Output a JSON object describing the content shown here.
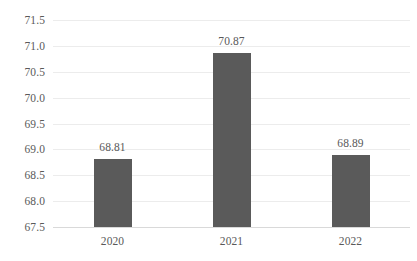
{
  "chart_data": {
    "type": "bar",
    "title": "",
    "subtitle": "",
    "xlabel": "",
    "ylabel": "",
    "categories": [
      "2020",
      "2021",
      "2022"
    ],
    "values": [
      68.81,
      70.87,
      68.89
    ],
    "data_labels": [
      "68.81",
      "70.87",
      "68.89"
    ],
    "ylim": [
      67.5,
      71.5
    ],
    "ytick_labels": [
      "71.5",
      "71.0",
      "70.5",
      "70.0",
      "69.5",
      "69.0",
      "68.5",
      "68.0",
      "67.5"
    ],
    "ytick_values": [
      71.5,
      71.0,
      70.5,
      70.0,
      69.5,
      69.0,
      68.5,
      68.0,
      67.5
    ],
    "grid": true,
    "legend": false,
    "legend_position": "none",
    "series": [
      {
        "name": "",
        "values": [
          68.81,
          70.87,
          68.89
        ]
      }
    ],
    "colors": {
      "bar": "#5a5a5a",
      "gridline": "#ececec",
      "baseline": "#d9d9d9",
      "tick_text": "#5a5a5a",
      "label_text": "#595959",
      "background": "#ffffff"
    }
  }
}
